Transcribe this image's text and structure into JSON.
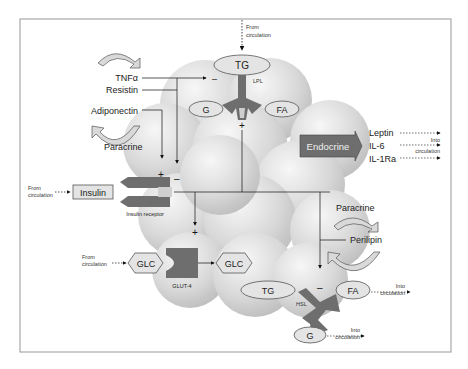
{
  "figure": {
    "frame_color": "#a8a8a8",
    "sphere_color": "#d6d6d6",
    "shape_dark": "#6e6e6e",
    "label_fill": "#e4e4e4"
  },
  "top": {
    "from_circulation": [
      "From",
      "circulation"
    ],
    "tg": "TG",
    "lpl": "LPL",
    "g": "G",
    "fa": "FA",
    "plus": "+"
  },
  "left": {
    "tnf": "TNFα",
    "resistin": "Resistin",
    "adiponectin": "Adiponectin",
    "paracrine": "Paracrine",
    "minus_lpl": "–",
    "plus": "+",
    "minus": "–"
  },
  "insulin": {
    "from_circulation": [
      "From",
      "circulation"
    ],
    "label": "Insulin",
    "receptor": "Insulin receptor"
  },
  "glucose": {
    "from_circulation": [
      "From",
      "circulation"
    ],
    "glc_in": "GLC",
    "glc_out": "GLC",
    "transporter": "GLUT-4",
    "plus": "+"
  },
  "endocrine": {
    "label": "Endocrine",
    "outputs": [
      "Leptin",
      "IL-6",
      "IL-1Ra"
    ],
    "into_circulation": [
      "Into",
      "circulation"
    ]
  },
  "right": {
    "paracrine": "Paracrine",
    "perilipin": "Perilipin"
  },
  "lipolysis": {
    "tg": "TG",
    "hsl": "HSL",
    "minus": "–",
    "fa": "FA",
    "g": "G",
    "fa_into": [
      "Into",
      "circulation"
    ],
    "g_into": [
      "Into",
      "circulation"
    ]
  }
}
